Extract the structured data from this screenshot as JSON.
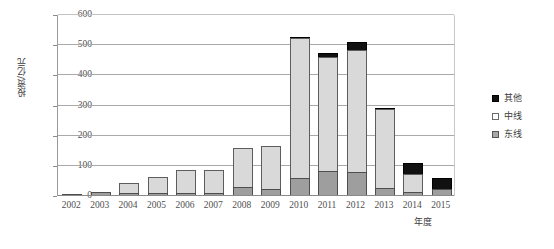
{
  "chart_data": {
    "type": "bar",
    "stacked": true,
    "title": "",
    "xlabel": "年度",
    "ylabel": "投资/亿元",
    "ylim": [
      0,
      600
    ],
    "ytick_step": 100,
    "yticks": [
      "600",
      "500",
      "400",
      "300",
      "200",
      "100",
      "0"
    ],
    "grid": true,
    "legend_position": "right",
    "categories": [
      "2002",
      "2003",
      "2004",
      "2005",
      "2006",
      "2007",
      "2008",
      "2009",
      "2010",
      "2011",
      "2012",
      "2013",
      "2014",
      "2015"
    ],
    "series": [
      {
        "name": "东线",
        "color": "#9e9e9e",
        "values": [
          1,
          12,
          11,
          11,
          11,
          10,
          31,
          24,
          61,
          84,
          78,
          25,
          12,
          24
        ]
      },
      {
        "name": "中线",
        "color": "#d9d9d9",
        "values": [
          1,
          2,
          35,
          54,
          79,
          81,
          132,
          144,
          466,
          379,
          410,
          268,
          64,
          0
        ]
      },
      {
        "name": "其他",
        "color": "#111111",
        "values": [
          0,
          0,
          0,
          0,
          0,
          0,
          0,
          0,
          8,
          18,
          30,
          4,
          41,
          38
        ]
      }
    ],
    "totals": [
      2,
      14,
      46,
      65,
      90,
      91,
      163,
      168,
      535,
      481,
      518,
      297,
      117,
      62
    ]
  },
  "legend": {
    "items": [
      {
        "label": "其他",
        "swatch": "black-square-swatch"
      },
      {
        "label": "中线",
        "swatch": "white-square-swatch"
      },
      {
        "label": "东线",
        "swatch": "gray-square-swatch"
      }
    ]
  }
}
